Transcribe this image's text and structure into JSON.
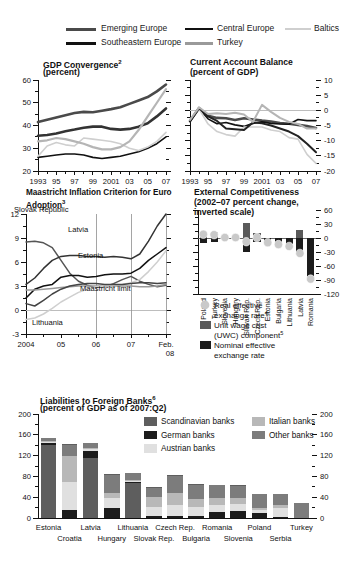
{
  "legend": {
    "items": [
      {
        "label": "Emerging Europe",
        "color": "#4a4a4a",
        "width": 2.6
      },
      {
        "label": "Central Europe",
        "color": "#111111",
        "width": 1.6
      },
      {
        "label": "Baltics",
        "color": "#cfcfcf",
        "width": 1.6
      },
      {
        "label": "Southeastern Europe",
        "color": "#111111",
        "width": 2.6
      },
      {
        "label": "Turkey",
        "color": "#9a9a9a",
        "width": 2.2
      }
    ]
  },
  "chart_data": [
    {
      "id": "gdp-convergence",
      "type": "line",
      "title": "GDP Convergence",
      "title_sup": "2",
      "subtitle": "(percent)",
      "xlabel": "",
      "ylabel": "",
      "ylim": [
        20,
        60
      ],
      "yticks": [
        20,
        30,
        40,
        50,
        60
      ],
      "x": [
        1993,
        1994,
        1995,
        1996,
        1997,
        1998,
        1999,
        2000,
        2001,
        2002,
        2003,
        2004,
        2005,
        2006,
        2007
      ],
      "xticklabels": [
        "1993",
        "95",
        "97",
        "99",
        "2001",
        "03",
        "05",
        "07"
      ],
      "xtickvalues": [
        1993,
        1995,
        1997,
        1999,
        2001,
        2003,
        2005,
        2007
      ],
      "grid": false,
      "series": [
        {
          "name": "Emerging Europe",
          "color": "#4a4a4a",
          "width": 2.6,
          "values": [
            41.5,
            42.5,
            43.5,
            44.5,
            45.5,
            46.0,
            45.8,
            46.5,
            47.2,
            48.0,
            49.5,
            51.0,
            52.5,
            55.0,
            58.0
          ]
        },
        {
          "name": "Central Europe",
          "color": "#111111",
          "width": 1.6,
          "values": [
            26.0,
            26.5,
            27.0,
            27.5,
            27.5,
            27.0,
            26.0,
            25.5,
            26.0,
            26.5,
            27.5,
            28.5,
            30.0,
            32.0,
            35.0
          ]
        },
        {
          "name": "Baltics",
          "color": "#cfcfcf",
          "width": 1.6,
          "values": [
            26.5,
            31.0,
            32.5,
            31.5,
            31.0,
            34.5,
            34.0,
            33.5,
            33.0,
            32.0,
            30.0,
            29.0,
            30.5,
            33.0,
            37.0
          ]
        },
        {
          "name": "Southeastern Europe",
          "color": "#333333",
          "width": 2.6,
          "values": [
            35.5,
            35.8,
            36.5,
            37.5,
            38.2,
            39.0,
            39.5,
            39.5,
            38.5,
            38.2,
            38.5,
            39.5,
            41.0,
            44.0,
            47.5
          ]
        },
        {
          "name": "Turkey",
          "color": "#b5b5b5",
          "width": 2.2,
          "values": [
            33.0,
            33.5,
            34.5,
            34.0,
            33.0,
            32.0,
            30.5,
            29.5,
            29.5,
            30.5,
            33.0,
            38.0,
            44.0,
            50.0,
            56.0
          ]
        }
      ]
    },
    {
      "id": "current-account-balance",
      "type": "line",
      "title": "Current Account Balance",
      "title_sup": "",
      "subtitle": "(percent of GDP)",
      "ylim": [
        -20,
        10
      ],
      "yticks": [
        10,
        5,
        0,
        -5,
        -10,
        -15,
        -20
      ],
      "x": [
        1993,
        1994,
        1995,
        1996,
        1997,
        1998,
        1999,
        2000,
        2001,
        2002,
        2003,
        2004,
        2005,
        2006,
        2007
      ],
      "xticklabels": [
        "1993",
        "95",
        "97",
        "99",
        "2001",
        "03",
        "05",
        "07"
      ],
      "xtickvalues": [
        1993,
        1995,
        1997,
        1999,
        2001,
        2003,
        2005,
        2007
      ],
      "grid": false,
      "zeroline": true,
      "series": [
        {
          "name": "Emerging Europe",
          "color": "#4a4a4a",
          "width": 2.6,
          "values": [
            -3.5,
            0.7,
            -1.8,
            -2.5,
            -2.6,
            -3.2,
            -2.6,
            -3.0,
            -3.4,
            -3.7,
            -4.2,
            -4.4,
            -4.8,
            -5.2,
            -5.8
          ]
        },
        {
          "name": "Central Europe",
          "color": "#111111",
          "width": 1.6,
          "values": [
            -3.7,
            0.6,
            -2.8,
            -4.4,
            -4.0,
            -4.8,
            -5.3,
            -4.3,
            -3.8,
            -4.3,
            -4.5,
            -4.6,
            -3.0,
            -3.4,
            -3.4
          ]
        },
        {
          "name": "Baltics",
          "color": "#cfcfcf",
          "width": 1.6,
          "values": [
            -3.0,
            0.5,
            -4.5,
            -7.0,
            -8.0,
            -8.5,
            -5.5,
            -5.5,
            -5.5,
            -6.5,
            -7.0,
            -9.0,
            -9.5,
            -14.5,
            -17.5
          ]
        },
        {
          "name": "Southeastern Europe",
          "color": "#222222",
          "width": 2.0,
          "values": [
            -3.6,
            0.8,
            -2.0,
            -3.5,
            -6.0,
            -6.2,
            -6.5,
            -4.0,
            -4.3,
            -5.0,
            -6.0,
            -7.0,
            -8.5,
            -11.0,
            -13.8
          ]
        },
        {
          "name": "Turkey",
          "color": "#b5b5b5",
          "width": 2.0,
          "values": [
            -3.2,
            1.0,
            -1.2,
            -1.0,
            -1.2,
            -0.8,
            -1.4,
            -3.8,
            1.8,
            -0.5,
            -2.5,
            -3.8,
            -4.5,
            -6.0,
            -6.0
          ]
        }
      ]
    },
    {
      "id": "maastricht-inflation",
      "type": "line",
      "title": "Maastricht Inflation Criterion for Euro Adoption",
      "title_sup": "3",
      "subtitle": "",
      "ylim": [
        -3,
        12
      ],
      "yticks": [
        12,
        9,
        6,
        3,
        0,
        -3
      ],
      "xticklabels": [
        "2004",
        "05",
        "06",
        "07",
        "Feb."
      ],
      "xticklabels2": [
        "",
        "",
        "",
        "",
        "08"
      ],
      "grid": true,
      "annotations": [
        {
          "text": "Slovak Republic",
          "x": 14,
          "y": 26
        },
        {
          "text": "Latvia",
          "x": 68,
          "y": 46
        },
        {
          "text": "Estonia",
          "x": 78,
          "y": 72
        },
        {
          "text": "Maastricht limit",
          "x": 80,
          "y": 105
        },
        {
          "text": "Lithuania",
          "x": 32,
          "y": 139
        }
      ],
      "series": [
        {
          "name": "Slovak Republic",
          "color": "#555555",
          "width": 1.5,
          "values": [
            8.5,
            8.6,
            8.4,
            7.8,
            6.2,
            4.6,
            3.6,
            3.1,
            2.8,
            2.9,
            3.3,
            3.8,
            4.2,
            3.6,
            3.2,
            2.9,
            3.1
          ]
        },
        {
          "name": "Latvia",
          "color": "#333333",
          "width": 1.5,
          "values": [
            3.2,
            4.0,
            5.2,
            6.2,
            6.7,
            6.8,
            6.8,
            6.7,
            6.7,
            6.6,
            6.7,
            6.6,
            6.4,
            7.0,
            8.6,
            10.5,
            12.0
          ]
        },
        {
          "name": "Estonia",
          "color": "#111111",
          "width": 1.5,
          "values": [
            1.5,
            2.6,
            3.0,
            3.2,
            4.1,
            4.3,
            4.3,
            4.1,
            4.2,
            4.4,
            4.5,
            4.5,
            4.6,
            5.2,
            6.2,
            7.0,
            7.8
          ]
        },
        {
          "name": "Maastricht limit",
          "color": "#999999",
          "width": 1.5,
          "values": [
            2.5,
            2.5,
            2.6,
            2.7,
            2.8,
            2.9,
            3.0,
            3.0,
            3.0,
            3.0,
            3.0,
            3.0,
            3.0,
            2.9,
            2.9,
            3.0,
            3.2
          ]
        },
        {
          "name": "Lithuania",
          "color": "#cfcfcf",
          "width": 1.5,
          "values": [
            -1.2,
            -1.0,
            -0.5,
            0.2,
            1.0,
            1.6,
            2.2,
            2.6,
            2.9,
            3.0,
            3.1,
            3.2,
            3.4,
            3.8,
            4.8,
            6.0,
            7.4
          ]
        },
        {
          "name": "Slovak upper",
          "color": "#444444",
          "width": 1.5,
          "values": [
            0.8,
            0.5,
            1.2,
            2.0,
            2.6,
            3.0,
            3.2,
            3.3,
            3.3,
            3.2,
            3.2,
            3.2,
            3.3,
            3.4,
            3.4,
            3.3,
            3.4
          ]
        }
      ]
    },
    {
      "id": "external-competitiveness",
      "type": "bar",
      "title": "External Competitiveness",
      "subtitle": "(2002–07 percent change, inverted scale)",
      "ylim": [
        -120,
        60
      ],
      "yticks": [
        60,
        30,
        0,
        -30,
        -60,
        -90,
        -120
      ],
      "categories": [
        "Poland",
        "Turkey",
        "Slovenia",
        "Hungary",
        "Slovak Rep.",
        "Czech Rep.",
        "Estonia",
        "Bulgaria",
        "Lithuania",
        "Latvia",
        "Romania"
      ],
      "legend": [
        {
          "label": "Real effective exchange rate",
          "sup": "4",
          "color": "#c9c9c9",
          "shape": "circle"
        },
        {
          "label": "Unit wage cost (UWC) component",
          "sup": "5",
          "color": "#5a5a5a",
          "shape": "square"
        },
        {
          "label": "Nominal effective exchange rate",
          "sup": "",
          "color": "#1c1c1c",
          "shape": "square"
        }
      ],
      "series": [
        {
          "name": "Unit wage cost (UWC) component",
          "color": "#5a5a5a",
          "values": [
            12,
            13,
            3,
            3,
            32,
            11,
            -4,
            -6,
            -8,
            18,
            -5
          ]
        },
        {
          "name": "Nominal effective exchange rate",
          "color": "#1c1c1c",
          "values": [
            -10,
            -9,
            -3,
            -3,
            -31,
            -9,
            -11,
            -10,
            -13,
            -32,
            -88
          ]
        },
        {
          "name": "Real effective exchange rate",
          "color": "#c9c9c9",
          "type": "marker",
          "values": [
            8,
            7,
            1,
            1,
            -8,
            1,
            -10,
            -14,
            -18,
            -33,
            -88
          ]
        }
      ]
    },
    {
      "id": "liabilities-foreign-banks",
      "type": "stacked-bar",
      "title": "Liabilities to Foreign Banks",
      "title_sup": "6",
      "subtitle": "(percent of GDP as of 2007:Q2)",
      "ylim": [
        0,
        200
      ],
      "yticks": [
        0,
        40,
        80,
        120,
        160,
        200
      ],
      "categories": [
        "Estonia",
        "Croatia",
        "Latvia",
        "Hungary",
        "Lithuania",
        "Slovak Rep.",
        "Czech Rep.",
        "Bulgaria",
        "Romania",
        "Slovenia",
        "Poland",
        "Serbia",
        "Turkey"
      ],
      "cat_rows": [
        [
          "Estonia",
          "",
          "Latvia",
          "",
          "Lithuania",
          "",
          "Czech Rep.",
          "",
          "Romania",
          "",
          "Poland",
          "",
          "Turkey"
        ],
        [
          "",
          "Croatia",
          "",
          "Hungary",
          "",
          "Slovak Rep.",
          "",
          "Bulgaria",
          "",
          "Slovenia",
          "",
          "Serbia",
          ""
        ]
      ],
      "legend": [
        {
          "label": "Scandinavian banks",
          "color": "#5e5e5e"
        },
        {
          "label": "Italian banks",
          "color": "#b8b8b8"
        },
        {
          "label": "German banks",
          "color": "#1c1c1c"
        },
        {
          "label": "Other banks",
          "color": "#7c7c7c"
        },
        {
          "label": "Austrian banks",
          "color": "#e0e0e0"
        }
      ],
      "series": [
        {
          "name": "Scandinavian banks",
          "color": "#5e5e5e",
          "values": [
            140,
            2,
            115,
            2,
            68,
            2,
            2,
            1,
            1,
            1,
            1,
            1,
            0
          ]
        },
        {
          "name": "German banks",
          "color": "#1c1c1c",
          "values": [
            5,
            15,
            13,
            20,
            2,
            3,
            3,
            3,
            11,
            13,
            10,
            2,
            0
          ]
        },
        {
          "name": "Austrian banks",
          "color": "#e0e0e0",
          "values": [
            2,
            54,
            4,
            18,
            2,
            19,
            22,
            18,
            14,
            14,
            5,
            17,
            0
          ]
        },
        {
          "name": "Italian banks",
          "color": "#b8b8b8",
          "values": [
            1,
            50,
            2,
            10,
            2,
            19,
            24,
            16,
            13,
            12,
            4,
            6,
            0
          ]
        },
        {
          "name": "Other banks",
          "color": "#7c7c7c",
          "values": [
            5,
            22,
            11,
            34,
            13,
            16,
            32,
            27,
            25,
            23,
            27,
            21,
            28
          ]
        }
      ]
    }
  ]
}
